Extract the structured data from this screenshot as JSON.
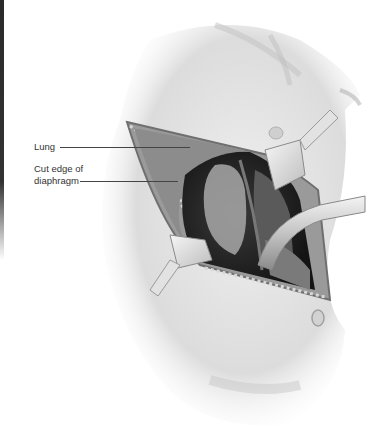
{
  "figure": {
    "labels": [
      {
        "id": "lung",
        "text": "Lung"
      },
      {
        "id": "diaphragm-line1",
        "text": "Cut edge of"
      },
      {
        "id": "diaphragm-line2",
        "text": "diaphragm"
      }
    ]
  },
  "colors": {
    "background": "#ffffff",
    "skin": "#e6e6e6",
    "cavity_dark": "#1e1e1e",
    "label_text": "#333333"
  }
}
